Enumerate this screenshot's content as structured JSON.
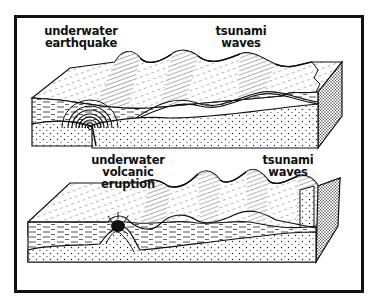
{
  "figure": {
    "border_color": "#111111",
    "background": "#ffffff",
    "panels": [
      {
        "name": "earthquake-panel",
        "labels": {
          "source_line1": "underwater",
          "source_line2": "earthquake",
          "waves_line1": "tsunami",
          "waves_line2": "waves"
        }
      },
      {
        "name": "volcanic-panel",
        "labels": {
          "source_line1": "underwater volcanic",
          "source_line2": "eruption",
          "waves_line1": "tsunami",
          "waves_line2": "waves"
        }
      }
    ]
  }
}
